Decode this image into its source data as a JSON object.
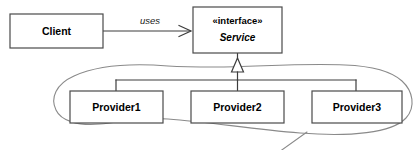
{
  "diagram": {
    "type": "uml-class-diagram",
    "background_color": "#ffffff",
    "line_color": "#3d3d3d",
    "annotation_color": "#8a8a8a",
    "nodes": {
      "client": {
        "label": "Client",
        "kind": "class",
        "x": 10,
        "y": 14,
        "w": 93,
        "h": 34
      },
      "service": {
        "stereotype": "«interface»",
        "label": "Service",
        "kind": "interface",
        "x": 193,
        "y": 7,
        "w": 89,
        "h": 46
      },
      "provider1": {
        "label": "Provider1",
        "kind": "class",
        "x": 70,
        "y": 91,
        "w": 93,
        "h": 32
      },
      "provider2": {
        "label": "Provider2",
        "kind": "class",
        "x": 191,
        "y": 91,
        "w": 93,
        "h": 32
      },
      "provider3": {
        "label": "Provider3",
        "kind": "class",
        "x": 312,
        "y": 91,
        "w": 90,
        "h": 32
      }
    },
    "edges": {
      "uses": {
        "label": "uses",
        "from": "client",
        "to": "service",
        "arrow": "open-arrow",
        "label_x": 150,
        "label_y": 21
      },
      "realization": {
        "label": "",
        "from": [
          "provider1",
          "provider2",
          "provider3"
        ],
        "to": "service",
        "arrow": "hollow-triangle"
      }
    },
    "annotation": {
      "name": "provider-group-lasso",
      "shape": "hand-drawn-ellipse",
      "has_leader_line": true
    }
  }
}
